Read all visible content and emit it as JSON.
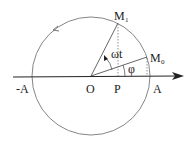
{
  "diagram": {
    "labels": {
      "neg_a": "-A",
      "origin": "O",
      "projection": "P",
      "pos_a": "A",
      "m1": "M",
      "m1_sub": "1",
      "m0": "M",
      "m0_sub": "0",
      "omega_t": "ωt",
      "phi": "φ"
    },
    "colors": {
      "stroke": "#555555",
      "axis": "#222222",
      "text": "#222222",
      "background": "#ffffff"
    }
  }
}
